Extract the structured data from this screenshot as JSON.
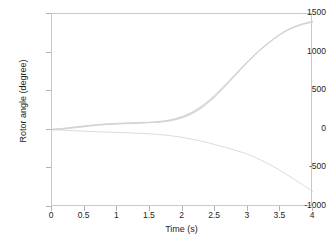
{
  "chart_data": {
    "type": "line",
    "title": "",
    "xlabel": "Time (s)",
    "ylabel": "Rotor angle (degree)",
    "xlim": [
      0,
      4
    ],
    "ylim": [
      -1000,
      1500
    ],
    "xticks": [
      "0",
      "0.5",
      "1",
      "1.5",
      "2",
      "2.5",
      "3",
      "3.5",
      "4"
    ],
    "xtick_values": [
      0,
      0.5,
      1,
      1.5,
      2,
      2.5,
      3,
      3.5,
      4
    ],
    "yticks": [
      "1500",
      "1000",
      "500",
      "0",
      "-500",
      "-1000"
    ],
    "ytick_values": [
      1500,
      1000,
      500,
      0,
      -500,
      -1000
    ],
    "grid": false,
    "legend": "none",
    "line_color": "#d2d2d2",
    "frame_color": "#c9c9c9",
    "x": [
      0,
      0.2,
      0.4,
      0.6,
      0.8,
      1.0,
      1.2,
      1.4,
      1.6,
      1.8,
      2.0,
      2.2,
      2.4,
      2.6,
      2.8,
      3.0,
      3.2,
      3.4,
      3.6,
      3.8,
      4.0
    ],
    "series": [
      {
        "name": "unstable-rising-trace-1",
        "values": [
          5,
          18,
          38,
          58,
          72,
          80,
          85,
          90,
          98,
          118,
          160,
          238,
          360,
          520,
          700,
          880,
          1040,
          1180,
          1290,
          1360,
          1405
        ]
      },
      {
        "name": "unstable-rising-trace-2",
        "values": [
          2,
          14,
          34,
          54,
          70,
          83,
          92,
          96,
          100,
          122,
          168,
          250,
          372,
          530,
          706,
          884,
          1042,
          1178,
          1286,
          1356,
          1398
        ]
      },
      {
        "name": "unstable-rising-trace-3",
        "values": [
          8,
          22,
          42,
          60,
          74,
          78,
          80,
          88,
          104,
          128,
          176,
          258,
          380,
          540,
          714,
          890,
          1046,
          1182,
          1292,
          1362,
          1410
        ]
      },
      {
        "name": "unstable-rising-trace-4",
        "values": [
          0,
          12,
          30,
          50,
          66,
          76,
          86,
          94,
          96,
          114,
          156,
          232,
          352,
          512,
          694,
          876,
          1036,
          1174,
          1284,
          1354,
          1396
        ]
      },
      {
        "name": "diverging-falling-trace",
        "values": [
          0,
          -6,
          -14,
          -22,
          -28,
          -34,
          -40,
          -48,
          -58,
          -74,
          -98,
          -130,
          -170,
          -214,
          -262,
          -318,
          -392,
          -480,
          -580,
          -690,
          -800
        ]
      }
    ]
  }
}
